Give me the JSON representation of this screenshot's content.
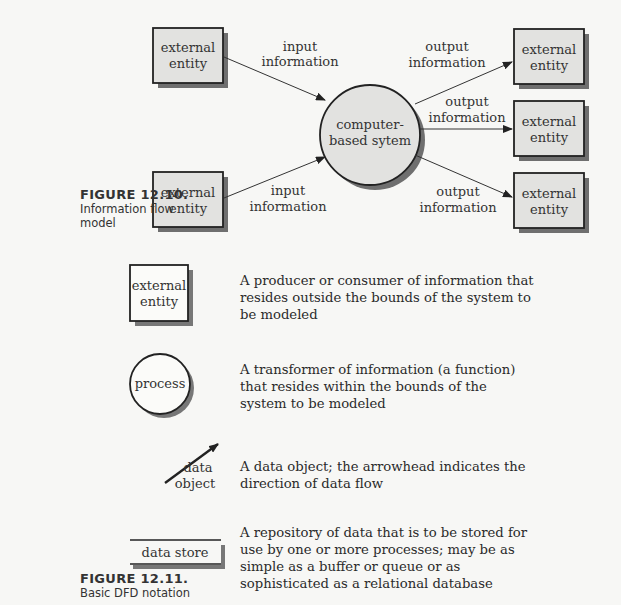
{
  "figure_12_10": {
    "caption_number": "FIGURE 12.10.",
    "caption_line1": "Information flow",
    "caption_line2": "model",
    "inputs": [
      {
        "entity_line1": "external",
        "entity_line2": "entity",
        "flow_line1": "input",
        "flow_line2": "information"
      },
      {
        "entity_line1": "external",
        "entity_line2": "entity",
        "flow_line1": "input",
        "flow_line2": "information"
      }
    ],
    "system": {
      "line1": "computer-",
      "line2": "based sytem"
    },
    "outputs": [
      {
        "entity_line1": "external",
        "entity_line2": "entity",
        "flow_line1": "output",
        "flow_line2": "information"
      },
      {
        "entity_line1": "external",
        "entity_line2": "entity",
        "flow_line1": "output",
        "flow_line2": "information"
      },
      {
        "entity_line1": "external",
        "entity_line2": "entity",
        "flow_line1": "output",
        "flow_line2": "information"
      }
    ]
  },
  "figure_12_11": {
    "caption_number": "FIGURE 12.11.",
    "caption_line1": "Basic DFD notation",
    "legend": [
      {
        "symbol": "external-entity",
        "label_line1": "external",
        "label_line2": "entity",
        "desc": [
          "A producer or consumer of information that",
          "resides outside the bounds of the system to",
          "be modeled"
        ]
      },
      {
        "symbol": "process",
        "label_line1": "process",
        "desc": [
          "A transformer of information (a function)",
          "that resides within the bounds of the",
          "system to be modeled"
        ]
      },
      {
        "symbol": "data-object",
        "label_line1": "data",
        "label_line2": "object",
        "desc": [
          "A data object; the arrowhead indicates the",
          "direction of data flow"
        ]
      },
      {
        "symbol": "data-store",
        "label_line1": "data store",
        "desc": [
          "A repository of data that is to be stored for",
          "use by one or more processes; may be as",
          "simple as a buffer or queue or as",
          "sophisticated as a relational database"
        ]
      }
    ]
  },
  "colors": {
    "fill": "#e2e2e0",
    "shadow": "#7a7a7a",
    "stroke": "#222222"
  }
}
